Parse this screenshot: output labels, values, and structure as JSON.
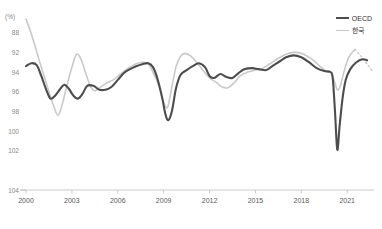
{
  "title": "",
  "unit_label": "(%)",
  "legend": {
    "position": "top-right",
    "items": [
      {
        "name": "oecd",
        "label": "OECD",
        "color": "#4d4d4d"
      },
      {
        "name": "korea",
        "label": "한국",
        "color": "#c9c9c9"
      }
    ]
  },
  "axes": {
    "y_ticks": [
      "104",
      "102",
      "100",
      "98",
      "96",
      "94",
      "92",
      "88"
    ],
    "x_ticks": [
      "2000",
      "2003",
      "2006",
      "2009",
      "2012",
      "2015",
      "2018",
      "2021"
    ]
  },
  "chart_data": {
    "type": "line",
    "title": "",
    "xlabel": "",
    "ylabel": "(%)",
    "ylim": [
      88,
      105.5
    ],
    "xlim": [
      2000,
      2022.75
    ],
    "grid": false,
    "legend_position": "top-right",
    "y_ticks": [
      88,
      92,
      94,
      96,
      98,
      100,
      102,
      104
    ],
    "x_ticks": [
      2000,
      2003,
      2006,
      2009,
      2012,
      2015,
      2018,
      2021
    ],
    "series": [
      {
        "name": "OECD",
        "color": "#4d4d4d",
        "linewidth": 2.1,
        "x": [
          2000.0,
          2000.35,
          2000.7,
          2001.0,
          2001.3,
          2001.6,
          2001.9,
          2002.2,
          2002.5,
          2002.8,
          2003.1,
          2003.4,
          2003.7,
          2004.0,
          2004.4,
          2004.8,
          2005.2,
          2005.6,
          2006.0,
          2006.4,
          2006.8,
          2007.2,
          2007.6,
          2008.0,
          2008.3,
          2008.6,
          2008.9,
          2009.1,
          2009.3,
          2009.55,
          2009.8,
          2010.1,
          2010.5,
          2010.9,
          2011.3,
          2011.7,
          2012.0,
          2012.3,
          2012.7,
          2013.1,
          2013.5,
          2013.9,
          2014.3,
          2014.8,
          2015.2,
          2015.7,
          2016.1,
          2016.6,
          2017.0,
          2017.5,
          2018.0,
          2018.5,
          2019.0,
          2019.5,
          2019.9,
          2020.05,
          2020.2,
          2020.35,
          2020.5,
          2020.7,
          2020.9,
          2021.2,
          2021.6,
          2022.0,
          2022.3
        ],
        "y": [
          100.6,
          100.9,
          100.7,
          99.6,
          98.3,
          97.3,
          97.6,
          98.2,
          98.7,
          98.3,
          97.6,
          97.3,
          97.8,
          98.6,
          98.6,
          98.2,
          98.2,
          98.5,
          99.2,
          99.9,
          100.3,
          100.6,
          100.8,
          100.9,
          100.5,
          99.3,
          97.4,
          95.8,
          95.1,
          96.1,
          98.3,
          99.7,
          100.2,
          100.6,
          100.9,
          100.5,
          99.6,
          99.4,
          99.8,
          99.5,
          99.4,
          99.9,
          100.3,
          100.4,
          100.3,
          100.2,
          100.6,
          101.1,
          101.5,
          101.7,
          101.5,
          101.0,
          100.4,
          100.1,
          100.0,
          99.4,
          96.0,
          92.1,
          94.5,
          97.4,
          99.2,
          100.3,
          101.0,
          101.3,
          101.2
        ],
        "style": "solid"
      },
      {
        "name": "한국",
        "color": "#c9c9c9",
        "linewidth": 1.6,
        "x": [
          2000.0,
          2000.3,
          2000.6,
          2000.9,
          2001.2,
          2001.5,
          2001.8,
          2002.1,
          2002.4,
          2002.7,
          2003.0,
          2003.3,
          2003.6,
          2003.9,
          2004.2,
          2004.5,
          2004.9,
          2005.3,
          2005.7,
          2006.1,
          2006.5,
          2006.9,
          2007.3,
          2007.7,
          2008.0,
          2008.3,
          2008.7,
          2009.0,
          2009.25,
          2009.5,
          2009.8,
          2010.1,
          2010.4,
          2010.8,
          2011.2,
          2011.6,
          2012.0,
          2012.4,
          2012.8,
          2013.2,
          2013.6,
          2014.0,
          2014.5,
          2015.0,
          2015.5,
          2016.0,
          2016.5,
          2017.0,
          2017.5,
          2018.0,
          2018.4,
          2018.8,
          2019.2,
          2019.6,
          2019.95,
          2020.15,
          2020.35,
          2020.55,
          2020.8,
          2021.1,
          2021.5
        ],
        "y": [
          105.4,
          104.1,
          102.6,
          101.0,
          99.5,
          98.0,
          96.6,
          95.6,
          96.9,
          98.8,
          100.5,
          101.8,
          101.3,
          99.9,
          98.6,
          98.1,
          98.5,
          98.9,
          99.2,
          99.7,
          100.2,
          100.6,
          100.9,
          101.0,
          100.8,
          100.0,
          98.5,
          96.9,
          96.4,
          98.2,
          100.5,
          101.6,
          101.9,
          101.6,
          100.9,
          100.1,
          99.4,
          99.0,
          98.5,
          98.4,
          98.9,
          99.6,
          100.0,
          100.2,
          100.4,
          100.9,
          101.4,
          101.8,
          102.0,
          101.9,
          101.6,
          101.2,
          100.6,
          100.1,
          99.9,
          99.1,
          98.2,
          98.6,
          100.1,
          101.5,
          102.3
        ],
        "style": "solid"
      },
      {
        "name": "한국-projection",
        "color": "#c9c9c9",
        "linewidth": 1.4,
        "x": [
          2021.5,
          2021.8,
          2022.1,
          2022.4,
          2022.7
        ],
        "y": [
          102.3,
          101.8,
          101.2,
          100.6,
          100.0
        ],
        "style": "dotted"
      }
    ]
  }
}
